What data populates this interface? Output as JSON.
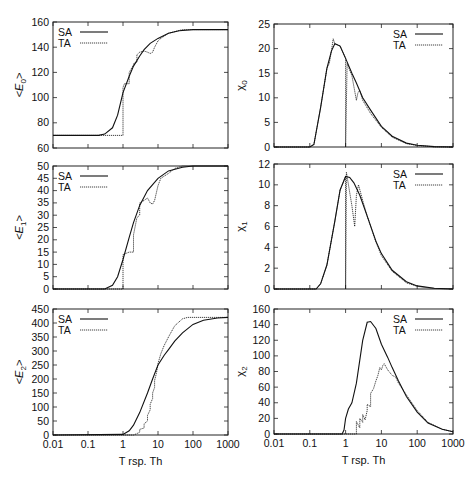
{
  "chart_data": [
    {
      "id": "E0",
      "type": "line",
      "panel": "top-left",
      "ylabel": "<E0>",
      "xlabel": "",
      "xscale": "log",
      "xlim": [
        0.01,
        1000
      ],
      "ylim": [
        60,
        160
      ],
      "yticks": [
        60,
        80,
        100,
        120,
        140,
        160
      ],
      "xticks": [
        0.01,
        0.1,
        1,
        10,
        100,
        1000
      ],
      "legend": [
        "SA",
        "TA"
      ],
      "legend_position": "top-left",
      "series": [
        {
          "name": "SA",
          "style": "solid",
          "x": [
            0.01,
            0.2,
            0.3,
            0.5,
            0.7,
            1,
            1.5,
            2,
            3,
            4,
            6,
            10,
            20,
            40,
            100,
            1000
          ],
          "y": [
            70,
            70,
            71,
            76,
            86,
            104,
            117,
            125,
            133,
            138,
            143,
            147,
            151,
            153,
            154,
            154
          ]
        },
        {
          "name": "TA",
          "style": "dotted",
          "x": [
            0.01,
            1,
            1,
            1.1,
            1.5,
            1.5,
            2,
            2,
            2.5,
            2.5,
            3,
            4,
            5,
            6,
            7,
            8,
            10,
            12,
            20,
            50,
            1000
          ],
          "y": [
            70,
            70,
            108,
            111,
            111,
            120,
            126,
            127,
            128,
            134,
            136,
            137,
            136,
            135,
            136,
            140,
            145,
            147,
            151,
            154,
            154
          ]
        }
      ]
    },
    {
      "id": "chi0",
      "type": "line",
      "panel": "top-right",
      "ylabel": "χ0",
      "xlabel": "",
      "xscale": "log",
      "xlim": [
        0.01,
        1000
      ],
      "ylim": [
        0,
        25
      ],
      "yticks": [
        0,
        5,
        10,
        15,
        20,
        25
      ],
      "xticks": [
        0.01,
        0.1,
        1,
        10,
        100,
        1000
      ],
      "legend": [
        "SA",
        "TA"
      ],
      "legend_position": "top-right",
      "series": [
        {
          "name": "SA",
          "style": "solid",
          "x": [
            0.01,
            0.1,
            0.13,
            0.2,
            0.3,
            0.4,
            0.5,
            0.7,
            1,
            1.5,
            2,
            3,
            5,
            10,
            20,
            50,
            100,
            300,
            1000
          ],
          "y": [
            0,
            0,
            0.5,
            8,
            16,
            19.5,
            21,
            20.5,
            18,
            15,
            13,
            10,
            7.5,
            4.2,
            2.2,
            0.8,
            0.35,
            0.08,
            0
          ]
        },
        {
          "name": "TA",
          "style": "dotted",
          "x": [
            0.01,
            0.1,
            0.13,
            0.2,
            0.3,
            0.35,
            0.4,
            0.45,
            0.5,
            0.6,
            0.7,
            1,
            1,
            1.1,
            1.5,
            2,
            2.2,
            2.5,
            3,
            5,
            10,
            20,
            50,
            100,
            300,
            1000
          ],
          "y": [
            0,
            0,
            0.5,
            8,
            16,
            17,
            19.5,
            22,
            21,
            20.8,
            20.5,
            18,
            0,
            17,
            14.5,
            9.5,
            11,
            11.5,
            9.5,
            6.8,
            4,
            2,
            0.7,
            0.3,
            0.05,
            0
          ]
        }
      ]
    },
    {
      "id": "E1",
      "type": "line",
      "panel": "middle-left",
      "ylabel": "<E1>",
      "xlabel": "",
      "xscale": "log",
      "xlim": [
        0.01,
        1000
      ],
      "ylim": [
        0,
        50
      ],
      "yticks": [
        0,
        5,
        10,
        15,
        20,
        25,
        30,
        35,
        40,
        45,
        50
      ],
      "xticks": [
        0.01,
        0.1,
        1,
        10,
        100,
        1000
      ],
      "legend": [
        "SA",
        "TA"
      ],
      "legend_position": "top-left",
      "series": [
        {
          "name": "SA",
          "style": "solid",
          "x": [
            0.01,
            0.3,
            0.5,
            0.7,
            1,
            1.5,
            2,
            3,
            5,
            10,
            20,
            50,
            100,
            1000
          ],
          "y": [
            0,
            0,
            1.5,
            5,
            12,
            21,
            27,
            34,
            40,
            45,
            48,
            49.5,
            50,
            50
          ]
        },
        {
          "name": "TA",
          "style": "dotted",
          "x": [
            0.01,
            1,
            1,
            1.5,
            2,
            2,
            2.5,
            3,
            3,
            4,
            5,
            6,
            7,
            8,
            10,
            12,
            20,
            30,
            50,
            1000
          ],
          "y": [
            0,
            0,
            14,
            15,
            15,
            22,
            29,
            30,
            35,
            36,
            37,
            35,
            34.5,
            36,
            42,
            45,
            47,
            49,
            50,
            50
          ]
        }
      ]
    },
    {
      "id": "chi1",
      "type": "line",
      "panel": "middle-right",
      "ylabel": "χ1",
      "xlabel": "",
      "xscale": "log",
      "xlim": [
        0.01,
        1000
      ],
      "ylim": [
        0,
        12
      ],
      "yticks": [
        0,
        2,
        4,
        6,
        8,
        10,
        12
      ],
      "xticks": [
        0.01,
        0.1,
        1,
        10,
        100,
        1000
      ],
      "legend": [
        "SA",
        "TA"
      ],
      "legend_position": "top-right",
      "series": [
        {
          "name": "SA",
          "style": "solid",
          "x": [
            0.01,
            0.15,
            0.2,
            0.3,
            0.5,
            0.7,
            1,
            1.3,
            1.7,
            2.5,
            4,
            7,
            10,
            20,
            50,
            100,
            300,
            1000
          ],
          "y": [
            0,
            0,
            0.5,
            2.3,
            6.5,
            9.5,
            10.8,
            10.7,
            10.2,
            9,
            7,
            4.6,
            3.4,
            1.8,
            0.7,
            0.3,
            0.08,
            0
          ]
        },
        {
          "name": "TA",
          "style": "dotted",
          "x": [
            0.01,
            0.15,
            0.2,
            0.3,
            0.5,
            0.7,
            1,
            1,
            1.05,
            1.5,
            1.8,
            2,
            2.3,
            3,
            4,
            7,
            10,
            20,
            50,
            100,
            300,
            1000
          ],
          "y": [
            0,
            0,
            0.5,
            2.3,
            6.5,
            9.5,
            10.8,
            0,
            11.2,
            8,
            6,
            9,
            10,
            8.5,
            7,
            4.5,
            3.2,
            1.7,
            0.6,
            0.25,
            0.05,
            0
          ]
        }
      ]
    },
    {
      "id": "E2",
      "type": "line",
      "panel": "bottom-left",
      "ylabel": "<E2>",
      "xlabel": "T rsp. Th",
      "xscale": "log",
      "xlim": [
        0.01,
        1000
      ],
      "ylim": [
        0,
        450
      ],
      "yticks": [
        0,
        50,
        100,
        150,
        200,
        250,
        300,
        350,
        400,
        450
      ],
      "xticks": [
        0.01,
        0.1,
        1,
        10,
        100,
        1000
      ],
      "legend": [
        "SA",
        "TA"
      ],
      "legend_position": "top-left",
      "series": [
        {
          "name": "SA",
          "style": "solid",
          "x": [
            0.01,
            1,
            1.5,
            2,
            3,
            5,
            7,
            10,
            15,
            20,
            30,
            50,
            100,
            200,
            500,
            1000
          ],
          "y": [
            0,
            2,
            15,
            35,
            80,
            150,
            200,
            250,
            285,
            305,
            335,
            365,
            395,
            410,
            418,
            420
          ]
        },
        {
          "name": "TA",
          "style": "dotted",
          "x": [
            0.01,
            2,
            2.5,
            3,
            3,
            4,
            4,
            5,
            5,
            6,
            6,
            7,
            7,
            8,
            8,
            9,
            10,
            12,
            15,
            20,
            30,
            50,
            70,
            1000
          ],
          "y": [
            0,
            0,
            5,
            10,
            20,
            25,
            40,
            50,
            70,
            90,
            110,
            130,
            150,
            170,
            195,
            220,
            255,
            290,
            320,
            350,
            390,
            415,
            420,
            420
          ]
        }
      ]
    },
    {
      "id": "chi2",
      "type": "line",
      "panel": "bottom-right",
      "ylabel": "χ2",
      "xlabel": "T rsp. Th",
      "xscale": "log",
      "xlim": [
        0.01,
        1000
      ],
      "ylim": [
        0,
        160
      ],
      "yticks": [
        0,
        20,
        40,
        60,
        80,
        100,
        120,
        140,
        160
      ],
      "xticks": [
        0.01,
        0.1,
        1,
        10,
        100,
        1000
      ],
      "legend": [
        "SA",
        "TA"
      ],
      "legend_position": "top-right",
      "series": [
        {
          "name": "SA",
          "style": "solid",
          "x": [
            0.01,
            0.8,
            0.9,
            1,
            1.2,
            1.5,
            2,
            3,
            4,
            5,
            7,
            10,
            15,
            20,
            30,
            50,
            100,
            200,
            500,
            1000
          ],
          "y": [
            0,
            0,
            5,
            20,
            32,
            40,
            65,
            120,
            143,
            144,
            135,
            115,
            98,
            85,
            68,
            48,
            28,
            14,
            6,
            3
          ]
        },
        {
          "name": "TA",
          "style": "dotted",
          "x": [
            0.01,
            2,
            2,
            2.5,
            2.5,
            3,
            3,
            3.5,
            4,
            4,
            5,
            5,
            6,
            7,
            8,
            9,
            10,
            11,
            12,
            15,
            20,
            25,
            30,
            50,
            100,
            200,
            500,
            1000
          ],
          "y": [
            0,
            0,
            16,
            8,
            20,
            15,
            25,
            18,
            30,
            38,
            35,
            52,
            58,
            68,
            75,
            85,
            82,
            88,
            90,
            82,
            75,
            73,
            65,
            50,
            30,
            15,
            6,
            3
          ]
        }
      ]
    }
  ],
  "legend_labels": {
    "sa": "SA",
    "ta": "TA"
  },
  "xtick_labels": [
    "0.01",
    "0.1",
    "1",
    "10",
    "100",
    "1000"
  ]
}
